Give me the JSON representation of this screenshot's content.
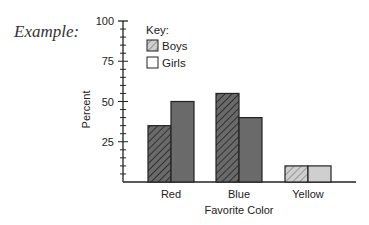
{
  "example_label": "Example:",
  "chart_data": {
    "type": "bar",
    "title": "",
    "xlabel": "Favorite Color",
    "ylabel": "Percent",
    "categories": [
      "Red",
      "Blue",
      "Yellow"
    ],
    "series": [
      {
        "name": "Boys",
        "values": [
          35,
          55,
          10
        ],
        "pattern": "hatched"
      },
      {
        "name": "Girls",
        "values": [
          50,
          40,
          10
        ],
        "pattern": "solid"
      }
    ],
    "ylim": [
      0,
      100
    ],
    "yticks": [
      25,
      50,
      75,
      100
    ],
    "grid": false,
    "legend": {
      "title": "Key:",
      "position": "top-left-inside"
    }
  }
}
